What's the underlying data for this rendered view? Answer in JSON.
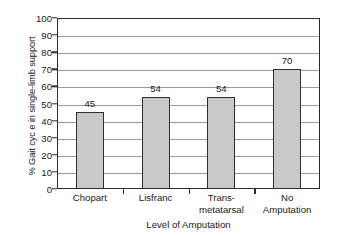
{
  "chart_data": {
    "type": "bar",
    "title": "",
    "categories": [
      "Chopart",
      "Lisfranc",
      "Trans-metatarsal",
      "No Amputation"
    ],
    "category_lines": [
      [
        "Chopart"
      ],
      [
        "Lisfranc"
      ],
      [
        "Trans-",
        "metatarsal"
      ],
      [
        "No",
        "Amputation"
      ]
    ],
    "values": [
      45,
      54,
      54,
      70
    ],
    "data_labels": [
      "45",
      "54",
      "54",
      "70"
    ],
    "xlabel": "Level of Amputation",
    "ylabel": "% Gait cyc e in single-limb support",
    "ylim": [
      0,
      100
    ],
    "ytick_values": [
      0,
      10,
      20,
      30,
      40,
      50,
      60,
      70,
      80,
      90,
      100
    ],
    "ytick_labels": [
      "0",
      "10",
      "20",
      "30",
      "40",
      "50",
      "60",
      "70",
      "80",
      "90",
      "100"
    ],
    "grid": true,
    "grid_axis": "y",
    "legend": false,
    "legend_position": "none",
    "bar_fill_color": "#c9c9c9",
    "bar_border_color": "#2e2e2e",
    "gridline_color": "#9a9a9a",
    "axis_color": "#2b2b2b",
    "background_color": "#ffffff"
  }
}
